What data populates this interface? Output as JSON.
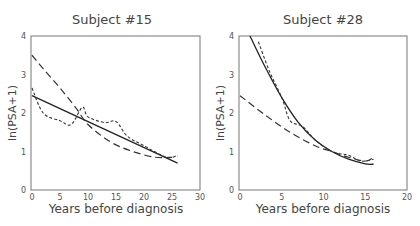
{
  "chart_data": [
    {
      "type": "line",
      "title": "Subject #15",
      "xlabel": "Years before diagnosis",
      "ylabel": "ln(PSA+1)",
      "xlim": [
        0,
        30
      ],
      "ylim": [
        0,
        4
      ],
      "xticks": [
        "0",
        "5",
        "10",
        "15",
        "20",
        "25",
        "30"
      ],
      "yticks": [
        "0",
        "1",
        "2",
        "3",
        "4"
      ],
      "grid": false,
      "series": [
        {
          "name": "solid",
          "style": "solid",
          "x": [
            0,
            26
          ],
          "y": [
            2.45,
            0.7
          ]
        },
        {
          "name": "long-dash",
          "style": "long-dash",
          "x": [
            0,
            2,
            5,
            8,
            10,
            14,
            18,
            22,
            25
          ],
          "y": [
            3.5,
            3.15,
            2.65,
            2.1,
            1.7,
            1.25,
            1.0,
            0.85,
            0.85
          ]
        },
        {
          "name": "short-dash",
          "style": "short-dash",
          "x": [
            0,
            2,
            5,
            7,
            9,
            10,
            13,
            15,
            17,
            20,
            24,
            26
          ],
          "y": [
            2.65,
            2.0,
            1.8,
            1.7,
            2.15,
            1.9,
            1.75,
            1.78,
            1.4,
            1.15,
            0.85,
            0.9
          ]
        }
      ]
    },
    {
      "type": "line",
      "title": "Subject #28",
      "xlabel": "Years before diagnosis",
      "ylabel": "ln(PSA+1)",
      "xlim": [
        0,
        20
      ],
      "ylim": [
        0,
        4
      ],
      "xticks": [
        "0",
        "5",
        "10",
        "15",
        "20"
      ],
      "yticks": [
        "0",
        "1",
        "2",
        "3",
        "4"
      ],
      "grid": false,
      "series": [
        {
          "name": "solid",
          "style": "solid",
          "x": [
            1.2,
            3,
            5,
            7,
            9,
            11,
            13,
            15,
            16
          ],
          "y": [
            4.0,
            3.2,
            2.4,
            1.75,
            1.3,
            1.0,
            0.8,
            0.68,
            0.67
          ]
        },
        {
          "name": "long-dash",
          "style": "long-dash",
          "x": [
            0,
            3,
            6,
            9,
            11,
            13,
            15,
            16
          ],
          "y": [
            2.45,
            1.95,
            1.5,
            1.15,
            1.0,
            0.85,
            0.75,
            0.85
          ]
        },
        {
          "name": "short-dash",
          "style": "short-dash",
          "x": [
            2.2,
            3.5,
            5,
            6,
            7.5,
            9,
            11,
            13,
            14.5,
            16
          ],
          "y": [
            3.85,
            3.1,
            2.4,
            1.8,
            1.65,
            1.3,
            1.0,
            0.9,
            0.75,
            0.8
          ]
        }
      ]
    }
  ],
  "panels": [
    {
      "title": "Subject #15",
      "xlabel": "Years before diagnosis",
      "ylabel": "ln(PSA+1)"
    },
    {
      "title": "Subject #28",
      "xlabel": "Years before diagnosis",
      "ylabel": "ln(PSA+1)"
    }
  ]
}
